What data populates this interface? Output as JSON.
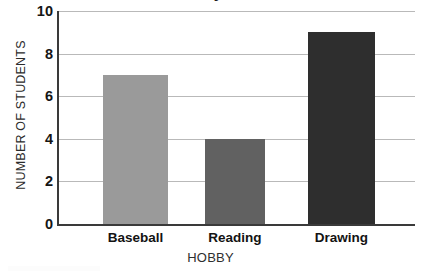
{
  "chart_data": {
    "type": "bar",
    "title": "Favorite Hobby of Students",
    "xlabel": "HOBBY",
    "ylabel": "NUMBER OF STUDENTS",
    "categories": [
      "Baseball",
      "Reading",
      "Drawing"
    ],
    "values": [
      7,
      4,
      9
    ],
    "bar_colors": [
      "#9a9a9a",
      "#616161",
      "#2e2e2e"
    ],
    "ylim": [
      0,
      10
    ],
    "ytick_labels": [
      "0",
      "2",
      "4",
      "6",
      "8",
      "10"
    ],
    "ytick_values": [
      0,
      2,
      4,
      6,
      8,
      10
    ],
    "grid": true,
    "legend": "none"
  },
  "style": {
    "background": "#ffffff",
    "axis_color": "#3a3a3a",
    "gridline_color": "#b9b9b9",
    "text_color": "#1a1a1a"
  }
}
